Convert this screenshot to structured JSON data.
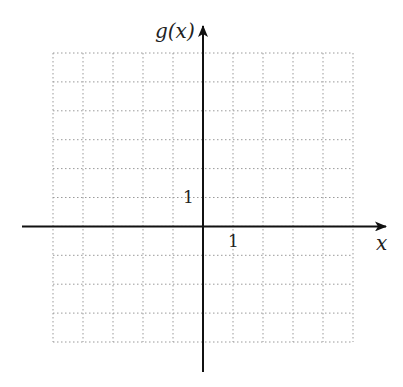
{
  "chart_data": {
    "type": "grid",
    "title": "",
    "xlabel": "x",
    "ylabel": "g(x)",
    "xlim": [
      -5,
      5
    ],
    "ylim": [
      -4,
      6
    ],
    "grid": true,
    "grid_style": "dotted",
    "tick_labels": {
      "x": "1",
      "y": "1"
    },
    "series": []
  },
  "colors": {
    "axis": "#111111",
    "grid": "#9a9a9a"
  }
}
